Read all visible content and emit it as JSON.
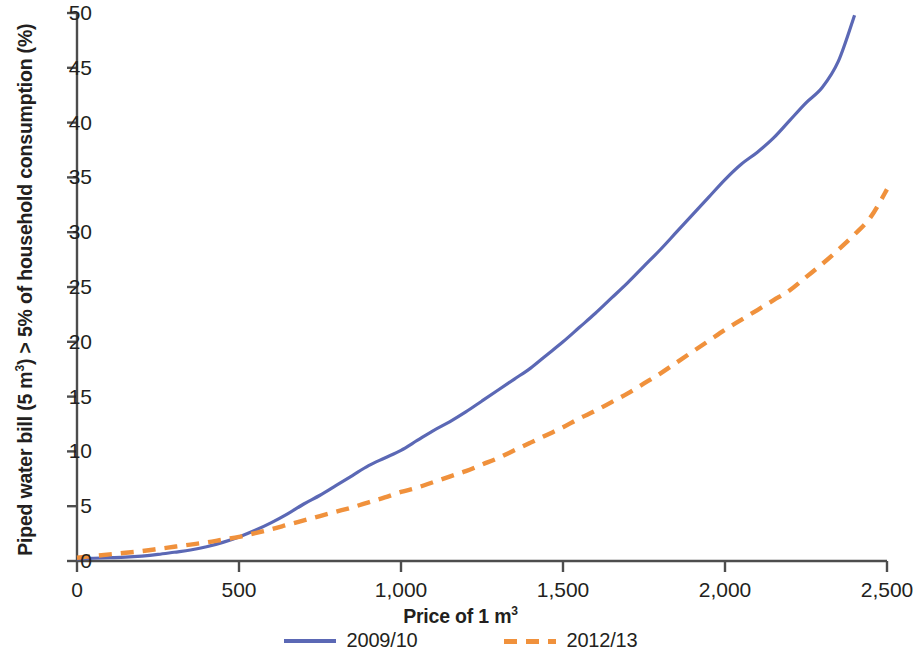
{
  "chart_data": {
    "type": "line",
    "title": "",
    "xlabel": "Price of 1 m³",
    "ylabel": "Piped water bill (5 m³) > 5% of household consumption (%)",
    "xlabel_main": "Price of 1 m",
    "xlabel_sup": "3",
    "ylabel_part1": "Piped water bill (5 m",
    "ylabel_sup1": "3",
    "ylabel_part2": ") > 5% of household consumption (%)",
    "xlim": [
      0,
      2500
    ],
    "ylim": [
      0,
      50
    ],
    "xticks": [
      0,
      500,
      1000,
      1500,
      2000,
      2500
    ],
    "xtick_labels": [
      "0",
      "500",
      "1,000",
      "1,500",
      "2,000",
      "2,500"
    ],
    "yticks": [
      0,
      5,
      10,
      15,
      20,
      25,
      30,
      35,
      40,
      45,
      50
    ],
    "ytick_labels": [
      "0",
      "5",
      "10",
      "15",
      "20",
      "25",
      "30",
      "35",
      "40",
      "45",
      "50"
    ],
    "grid": false,
    "legend_position": "below-axis",
    "series": [
      {
        "name": "2009/10",
        "color": "#5b68b5",
        "style": "solid",
        "x": [
          0,
          50,
          100,
          150,
          200,
          250,
          300,
          350,
          400,
          450,
          500,
          550,
          600,
          650,
          700,
          750,
          800,
          850,
          900,
          950,
          1000,
          1050,
          1100,
          1150,
          1200,
          1250,
          1300,
          1350,
          1400,
          1450,
          1500,
          1550,
          1600,
          1650,
          1700,
          1750,
          1800,
          1850,
          1900,
          1950,
          2000,
          2050,
          2100,
          2150,
          2200,
          2250,
          2300,
          2350,
          2400
        ],
        "y": [
          0.2,
          0.25,
          0.3,
          0.35,
          0.45,
          0.6,
          0.8,
          1.0,
          1.3,
          1.7,
          2.2,
          2.8,
          3.5,
          4.3,
          5.2,
          6.0,
          6.9,
          7.8,
          8.7,
          9.4,
          10.1,
          11.0,
          11.9,
          12.7,
          13.6,
          14.6,
          15.6,
          16.6,
          17.6,
          18.8,
          20.0,
          21.3,
          22.6,
          24.0,
          25.4,
          26.9,
          28.4,
          30.0,
          31.6,
          33.2,
          34.8,
          36.2,
          37.3,
          38.6,
          40.2,
          41.8,
          43.2,
          45.6,
          49.8
        ]
      },
      {
        "name": "2012/13",
        "color": "#f0913c",
        "style": "dashed",
        "x": [
          0,
          50,
          100,
          150,
          200,
          250,
          300,
          350,
          400,
          450,
          500,
          550,
          600,
          650,
          700,
          750,
          800,
          850,
          900,
          950,
          1000,
          1050,
          1100,
          1150,
          1200,
          1250,
          1300,
          1350,
          1400,
          1450,
          1500,
          1550,
          1600,
          1650,
          1700,
          1750,
          1800,
          1850,
          1900,
          1950,
          2000,
          2050,
          2100,
          2150,
          2200,
          2250,
          2300,
          2350,
          2400,
          2450,
          2500
        ],
        "y": [
          0.3,
          0.45,
          0.6,
          0.75,
          0.9,
          1.1,
          1.3,
          1.5,
          1.7,
          1.95,
          2.2,
          2.55,
          2.9,
          3.3,
          3.7,
          4.1,
          4.5,
          4.9,
          5.35,
          5.8,
          6.3,
          6.7,
          7.2,
          7.7,
          8.2,
          8.8,
          9.4,
          10.1,
          10.8,
          11.5,
          12.2,
          13.0,
          13.7,
          14.5,
          15.3,
          16.2,
          17.1,
          18.1,
          19.1,
          20.1,
          21.1,
          22.0,
          22.9,
          23.8,
          24.7,
          25.9,
          27.1,
          28.4,
          29.8,
          31.4,
          33.9
        ]
      }
    ],
    "annotations": []
  },
  "legend": {
    "items": [
      {
        "label": "2009/10",
        "color": "#5b68b5",
        "style": "solid"
      },
      {
        "label": "2012/13",
        "color": "#f0913c",
        "style": "dashed"
      }
    ]
  },
  "colors": {
    "axis": "#4d4d4d",
    "text": "#231f20",
    "series_2009_10": "#5b68b5",
    "series_2012_13": "#f0913c",
    "background": "#ffffff"
  }
}
